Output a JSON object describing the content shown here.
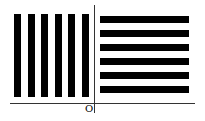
{
  "diagram": {
    "origin_label": "O",
    "colors": {
      "bar": "#000000",
      "axis": "#333333",
      "background": "#ffffff"
    },
    "left_group": {
      "orientation": "vertical",
      "count": 6
    },
    "right_group": {
      "orientation": "horizontal",
      "count": 6
    }
  }
}
